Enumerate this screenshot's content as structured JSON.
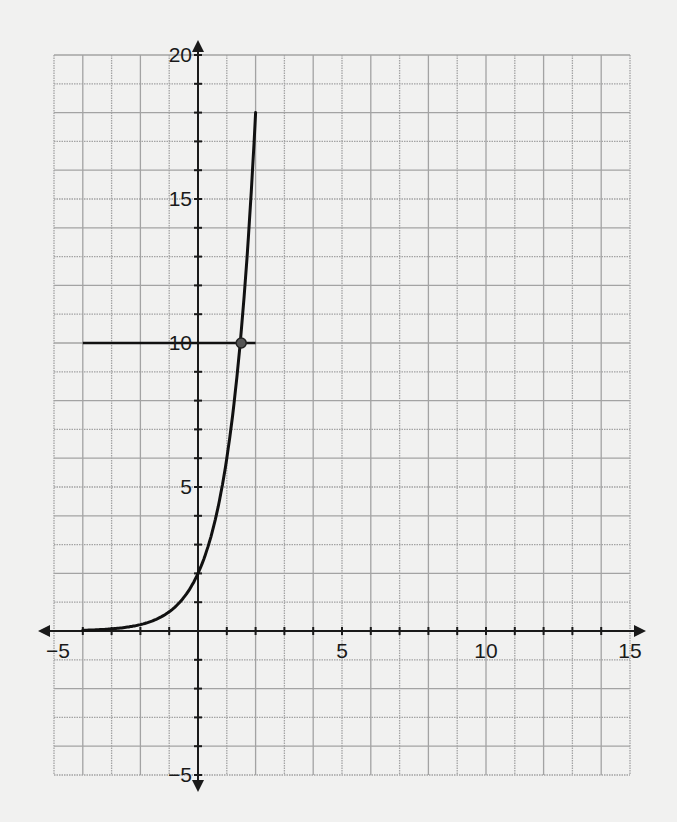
{
  "chart_data": {
    "type": "line",
    "title": "",
    "xlabel": "",
    "ylabel": "",
    "xlim": [
      -5,
      15
    ],
    "ylim": [
      -5,
      20
    ],
    "grid": true,
    "grid_step": 1,
    "x_tick_labels": [
      "-5",
      "5",
      "10",
      "15"
    ],
    "x_tick_label_values": [
      -5,
      5,
      10,
      15
    ],
    "y_tick_labels": [
      "20",
      "15",
      "10",
      "5",
      "-5"
    ],
    "y_tick_label_values": [
      20,
      15,
      10,
      5,
      -5
    ],
    "series": [
      {
        "name": "exponential curve (approx. y = 2·3^x)",
        "x": [
          -4,
          -3,
          -2,
          -1,
          0,
          0.5,
          1,
          1.5,
          2
        ],
        "y": [
          0.02,
          0.07,
          0.22,
          0.67,
          2,
          3.46,
          6,
          10.39,
          18
        ]
      },
      {
        "name": "horizontal line y = 10",
        "x": [
          -4,
          2
        ],
        "y": [
          10,
          10
        ]
      }
    ],
    "annotations": [
      {
        "type": "point",
        "label": "intersection",
        "x": 1.5,
        "y": 10
      }
    ],
    "legend": null
  },
  "axes": {
    "x_labels": [
      {
        "text": "−5",
        "value": -5
      },
      {
        "text": "5",
        "value": 5
      },
      {
        "text": "10",
        "value": 10
      },
      {
        "text": "15",
        "value": 15
      }
    ],
    "y_labels": [
      {
        "text": "20",
        "value": 20
      },
      {
        "text": "15",
        "value": 15
      },
      {
        "text": "10",
        "value": 10
      },
      {
        "text": "5",
        "value": 5
      },
      {
        "text": "−5",
        "value": -5
      }
    ]
  },
  "colors": {
    "background": "#f1f1f0",
    "grid": "#a3a3a3",
    "ink": "#111111"
  }
}
